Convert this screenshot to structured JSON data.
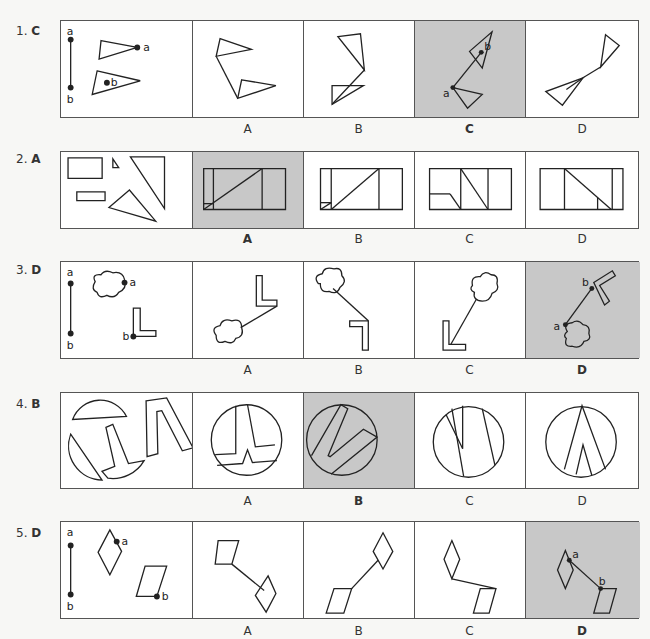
{
  "questions": [
    {
      "number": "1.",
      "answer": "C",
      "options": [
        "A",
        "B",
        "C",
        "D"
      ],
      "selected": "C",
      "point_labels": [
        "a",
        "b"
      ]
    },
    {
      "number": "2.",
      "answer": "A",
      "options": [
        "A",
        "B",
        "C",
        "D"
      ],
      "selected": "A"
    },
    {
      "number": "3.",
      "answer": "D",
      "options": [
        "A",
        "B",
        "C",
        "D"
      ],
      "selected": "D",
      "point_labels": [
        "a",
        "b"
      ]
    },
    {
      "number": "4.",
      "answer": "B",
      "options": [
        "A",
        "B",
        "C",
        "D"
      ],
      "selected": "B"
    },
    {
      "number": "5.",
      "answer": "D",
      "options": [
        "A",
        "B",
        "C",
        "D"
      ],
      "selected": "D",
      "point_labels": [
        "a",
        "b"
      ]
    }
  ],
  "colors": {
    "selected_bg": "#c8c8c8",
    "line": "#222222",
    "panel_bg": "#ffffff",
    "page_bg": "#f7f7f5"
  }
}
